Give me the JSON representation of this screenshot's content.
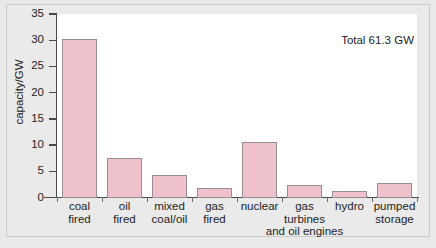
{
  "chart_data": {
    "type": "bar",
    "title": "",
    "subtitle": "",
    "xlabel": "",
    "ylabel": "capacity/GW",
    "ylim": [
      0,
      35
    ],
    "yticks": [
      0,
      5,
      10,
      15,
      20,
      25,
      30,
      35
    ],
    "ytick_labels": [
      "0",
      "5",
      "10",
      "15",
      "20",
      "25",
      "30",
      "35"
    ],
    "grid": false,
    "legend": null,
    "annotations": [
      "Total 61.3 GW"
    ],
    "categories": [
      "coal fired",
      "oil fired",
      "mixed coal/oil",
      "gas fired",
      "nuclear",
      "gas turbines and oil engines",
      "hydro",
      "pumped storage"
    ],
    "category_label_lines": [
      [
        "coal",
        "fired"
      ],
      [
        "oil",
        "fired"
      ],
      [
        "mixed",
        "coal/oil"
      ],
      [
        "gas",
        "fired"
      ],
      [
        "nuclear"
      ],
      [
        "gas",
        "turbines"
      ],
      [
        "hydro"
      ],
      [
        "pumped",
        "storage"
      ]
    ],
    "category_extra_line": "and oil engines",
    "values": [
      30.3,
      7.5,
      4.2,
      1.9,
      10.6,
      2.3,
      1.2,
      2.7
    ],
    "bar_color": "#efc1cb",
    "bar_border_color": "#9c8d93",
    "total": "61.3",
    "units": "GW"
  },
  "figure": {
    "background_color": "#e9e9e9",
    "plot_background_color": "#ffffff",
    "border_color": "#c9c9c9",
    "axis_color": "#4a4a4a",
    "text_color": "#1d1d1d"
  }
}
